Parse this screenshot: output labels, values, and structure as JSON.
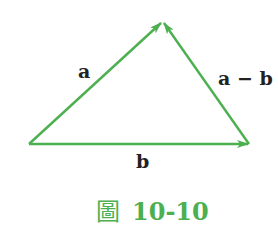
{
  "figure": {
    "colors": {
      "vector": "#4caf50",
      "label": "#222222",
      "caption": "#4caf50"
    },
    "points": {
      "origin": [
        29,
        144
      ],
      "apex": [
        163,
        21
      ],
      "right": [
        249,
        144
      ]
    },
    "vectors": [
      {
        "name": "a",
        "from": "origin",
        "to": "apex"
      },
      {
        "name": "b",
        "from": "origin",
        "to": "right"
      },
      {
        "name": "a-b",
        "from": "right",
        "to": "apex"
      }
    ],
    "labels": {
      "a": "a",
      "a_minus_b": "a − b",
      "b": "b"
    },
    "caption": {
      "prefix": "圖",
      "number": "10-10"
    }
  }
}
